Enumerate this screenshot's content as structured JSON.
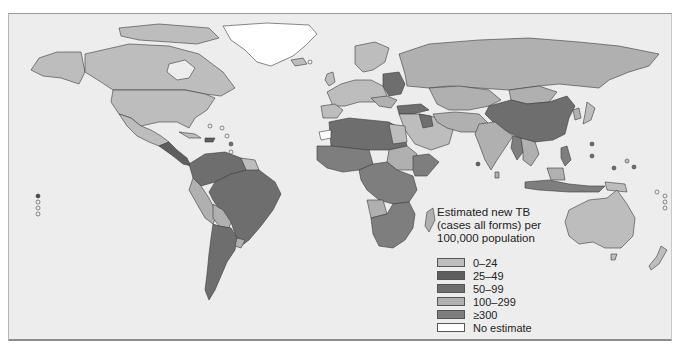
{
  "map": {
    "title": "Estimated new TB (cases all forms) per 100,000 population",
    "title_lines": [
      "Estimated new TB",
      "(cases all forms) per",
      "100,000 population"
    ],
    "background": "#ededed"
  },
  "legend": {
    "items": [
      {
        "label": "0–24",
        "color": "#bdbdbd"
      },
      {
        "label": "25–49",
        "color": "#5e5e5e"
      },
      {
        "label": "50–99",
        "color": "#6e6e6e"
      },
      {
        "label": "100–299",
        "color": "#b0b0b0"
      },
      {
        "label": "≥300",
        "color": "#7e7e7e"
      },
      {
        "label": "No estimate",
        "color": "#ffffff"
      }
    ]
  },
  "regions": {
    "north_america": "0–24",
    "greenland": "No estimate",
    "central_america": "25–49",
    "south_america_north": "50–99",
    "brazil": "50–99",
    "argentina": "50–99",
    "peru_bolivia": "100–299",
    "europe_west": "0–24",
    "eastern_europe": "50–99",
    "russia": "100–299",
    "north_africa": "50–99",
    "sub_saharan_africa": "≥300",
    "middle_east": "0–24",
    "central_asia": "100–299",
    "south_asia": "100–299",
    "china": "50–99",
    "southeast_asia": "≥300",
    "australia": "0–24",
    "new_zealand": "0–24"
  }
}
